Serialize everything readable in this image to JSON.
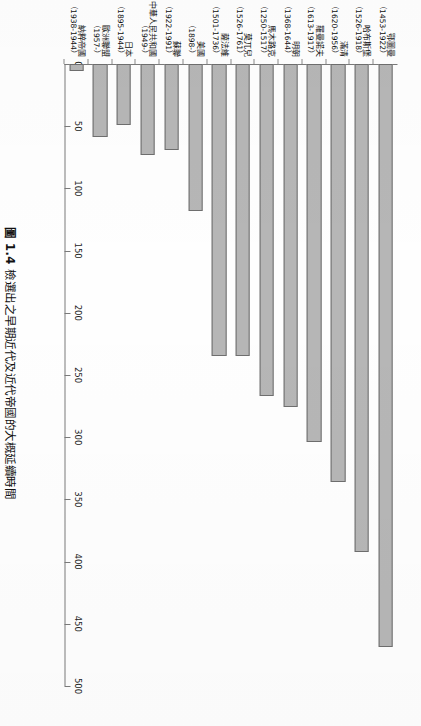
{
  "figure": {
    "number": "圖 1.4",
    "caption": "檢選出之早期近代及近代帝國的大概延續時間",
    "full_caption": "圖 1.4 檢選出之早期近代及近代帝國的大概延續時間"
  },
  "chart_data": {
    "type": "bar",
    "orientation": "horizontal",
    "title": "圖 1.4 檢選出之早期近代及近代帝國的大概延續時間",
    "xlabel": "",
    "ylabel": "",
    "xlim": [
      0,
      500
    ],
    "grid": false,
    "legend": null,
    "bar_color": "#b6b6b6",
    "bar_border_color": "#6e6e6e",
    "tick_labels": [
      "0",
      "50",
      "100",
      "150",
      "200",
      "250",
      "300",
      "350",
      "400",
      "450",
      "500"
    ],
    "ticks": [
      0,
      50,
      100,
      150,
      200,
      250,
      300,
      350,
      400,
      450,
      500
    ],
    "categories": [
      "鄂圖曼",
      "哈布斯堡",
      "滿清",
      "羅曼諾夫",
      "明朝",
      "馬木路克",
      "莫兀兒",
      "薩法維",
      "美國",
      "蘇聯",
      "中華人民共和國",
      "日本",
      "歐洲聯盟",
      "納粹帝國"
    ],
    "category_years": [
      "（1453-\n1922）",
      "（1526-\n1918）",
      "（1620-\n1956）",
      "（1613-\n1917）",
      "（1368-\n1644）",
      "（1250-\n1517）",
      "（1526-\n1761）",
      "（1501-\n1736）",
      "（1898-）",
      "（1922-\n1991）",
      "（1949-）",
      "（1895-\n1944）",
      "（1957-）",
      "（1938-\n1944）"
    ],
    "values": [
      469,
      392,
      336,
      304,
      276,
      267,
      235,
      235,
      118,
      69,
      73,
      49,
      59,
      6
    ],
    "bars": [
      {
        "label": "鄂圖曼",
        "years": "（1453-1922）",
        "year_start": 1453,
        "year_end": 1922,
        "value": 469
      },
      {
        "label": "哈布斯堡",
        "years": "（1526-1918）",
        "year_start": 1526,
        "year_end": 1918,
        "value": 392
      },
      {
        "label": "滿清",
        "years": "（1620-1956）",
        "year_start": 1620,
        "year_end": 1956,
        "value": 336
      },
      {
        "label": "羅曼諾夫",
        "years": "（1613-1917）",
        "year_start": 1613,
        "year_end": 1917,
        "value": 304
      },
      {
        "label": "明朝",
        "years": "（1368-1644）",
        "year_start": 1368,
        "year_end": 1644,
        "value": 276
      },
      {
        "label": "馬木路克",
        "years": "（1250-1517）",
        "year_start": 1250,
        "year_end": 1517,
        "value": 267
      },
      {
        "label": "莫兀兒",
        "years": "（1526-1761）",
        "year_start": 1526,
        "year_end": 1761,
        "value": 235
      },
      {
        "label": "薩法維",
        "years": "（1501-1736）",
        "year_start": 1501,
        "year_end": 1736,
        "value": 235
      },
      {
        "label": "美國",
        "years": "（1898-）",
        "year_start": 1898,
        "year_end": null,
        "value": 118
      },
      {
        "label": "蘇聯",
        "years": "（1922-1991）",
        "year_start": 1922,
        "year_end": 1991,
        "value": 69
      },
      {
        "label": "中華人民共和國",
        "years": "（1949-）",
        "year_start": 1949,
        "year_end": null,
        "value": 73
      },
      {
        "label": "日本",
        "years": "（1895-1944）",
        "year_start": 1895,
        "year_end": 1944,
        "value": 49
      },
      {
        "label": "歐洲聯盟",
        "years": "（1957-）",
        "year_start": 1957,
        "year_end": null,
        "value": 59
      },
      {
        "label": "納粹帝國",
        "years": "（1938-1944）",
        "year_start": 1938,
        "year_end": 1944,
        "value": 6
      }
    ]
  }
}
